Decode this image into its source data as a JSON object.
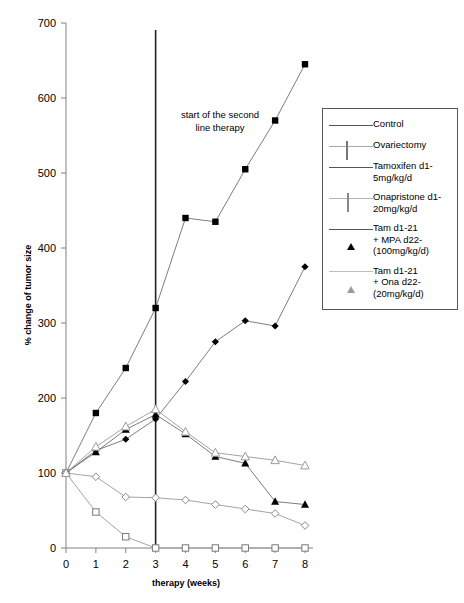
{
  "chart_data": {
    "type": "line",
    "title": "",
    "xlabel": "therapy (weeks)",
    "ylabel": "% change of tumor size",
    "x": [
      0,
      1,
      2,
      3,
      4,
      5,
      6,
      7,
      8
    ],
    "xlim": [
      0,
      8
    ],
    "ylim": [
      0,
      700
    ],
    "xticks": [
      "0",
      "1",
      "2",
      "3",
      "4",
      "5",
      "6",
      "7",
      "8"
    ],
    "yticks": [
      "0",
      "100",
      "200",
      "300",
      "400",
      "500",
      "600",
      "700"
    ],
    "grid": false,
    "legend_position": "right",
    "annotations": [
      {
        "text": "start of the second\nline therapy",
        "x": 3,
        "note": "vertical rule at week 3 marking start of second line therapy"
      }
    ],
    "series": [
      {
        "name": "Control",
        "marker": "filled-square",
        "color": "#000000",
        "values": [
          100,
          180,
          240,
          320,
          440,
          435,
          505,
          570,
          645
        ]
      },
      {
        "name": "Ovariectomy",
        "marker": "open-square",
        "color": "#777777",
        "values": [
          100,
          48,
          15,
          0,
          0,
          0,
          0,
          0,
          0
        ]
      },
      {
        "name": "Tamoxifen d1-\n5mg/kg/d",
        "marker": "filled-diamond",
        "color": "#000000",
        "values": [
          100,
          130,
          145,
          172,
          222,
          275,
          303,
          296,
          375
        ]
      },
      {
        "name": "Onapristone d1-\n20mg/kg/d",
        "marker": "open-diamond",
        "color": "#888888",
        "values": [
          100,
          95,
          68,
          67,
          64,
          58,
          52,
          46,
          30
        ]
      },
      {
        "name": "Tam d1-21\n+ MPA d22-\n(100mg/kg/d)",
        "marker": "filled-triangle",
        "color": "#000000",
        "values": [
          100,
          128,
          158,
          178,
          152,
          122,
          113,
          62,
          58
        ]
      },
      {
        "name": "Tam d1-21\n+ Ona d22-\n(20mg/kg/d)",
        "marker": "open-triangle",
        "color": "#9a9a9a",
        "values": [
          100,
          135,
          162,
          185,
          155,
          127,
          122,
          117,
          110
        ]
      }
    ]
  },
  "legend": {
    "items": [
      {
        "label": "Control",
        "key": "filled-square-key"
      },
      {
        "label": "Ovariectomy",
        "key": "open-square-key"
      },
      {
        "label": "Tamoxifen d1-\n5mg/kg/d",
        "key": "filled-diamond-key"
      },
      {
        "label": "Onapristone d1-\n20mg/kg/d",
        "key": "open-diamond-key"
      },
      {
        "label": "Tam d1-21\n+ MPA d22-\n(100mg/kg/d)",
        "key": "filled-triangle-key"
      },
      {
        "label": "Tam d1-21\n+ Ona d22-\n(20mg/kg/d)",
        "key": "open-triangle-key"
      }
    ]
  },
  "axes": {
    "x_title": "therapy (weeks)",
    "y_title": "% change of tumor size"
  },
  "annotation": {
    "line1": "start of the second",
    "line2": "line therapy"
  },
  "colors": {
    "axis": "#808080",
    "marker_black": "#000000",
    "marker_grey": "#888888",
    "vline": "#222222",
    "legend_border": "#555555"
  }
}
